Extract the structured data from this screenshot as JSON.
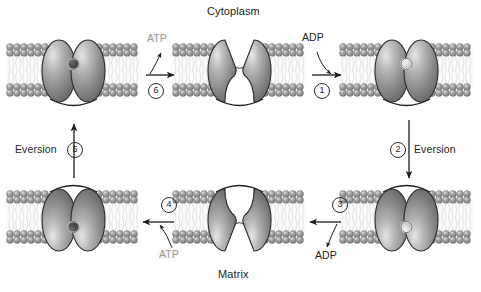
{
  "diagram": {
    "title_top": "Cytoplasm",
    "title_bottom": "Matrix",
    "type": "transport-cycle",
    "colors": {
      "protein_fill": "#8d8d8d",
      "protein_highlight": "#d8d8d8",
      "protein_outline": "#2b2b2b",
      "lipid_head": "#9a9a9a",
      "lipid_tail": "#f2f2f2",
      "arrow": "#1d1d1d",
      "atp_text": "#9b9b9b",
      "adp_text": "#1d1d1d",
      "substrate_dark": "#4a4a4a",
      "substrate_light": "#dcdcdc"
    }
  },
  "states": [
    {
      "id": "state-top-left",
      "name": "cytoplasm-facing-atp-bound",
      "orientation": "open-down",
      "substrate": "ATP",
      "substrate_shade": "dark"
    },
    {
      "id": "state-top-middle",
      "name": "cytoplasm-facing-empty",
      "orientation": "open-up",
      "substrate": "none",
      "substrate_shade": "none"
    },
    {
      "id": "state-top-right",
      "name": "cytoplasm-facing-adp-bound",
      "orientation": "open-down",
      "substrate": "ADP",
      "substrate_shade": "light"
    },
    {
      "id": "state-bottom-right",
      "name": "matrix-facing-adp-bound",
      "orientation": "open-up",
      "substrate": "ADP",
      "substrate_shade": "light"
    },
    {
      "id": "state-bottom-middle",
      "name": "matrix-facing-empty",
      "orientation": "open-down",
      "substrate": "none",
      "substrate_shade": "none"
    },
    {
      "id": "state-bottom-left",
      "name": "matrix-facing-atp-bound",
      "orientation": "open-up",
      "substrate": "ATP",
      "substrate_shade": "dark"
    }
  ],
  "steps": [
    {
      "number": "1",
      "glyph": "1",
      "label": "",
      "ligand": "ADP",
      "ligand_action": "binds",
      "direction": "right"
    },
    {
      "number": "2",
      "glyph": "2",
      "label": "Eversion",
      "ligand": "",
      "ligand_action": "",
      "direction": "down"
    },
    {
      "number": "3",
      "glyph": "3",
      "label": "",
      "ligand": "ADP",
      "ligand_action": "released",
      "direction": "left"
    },
    {
      "number": "4",
      "glyph": "4",
      "label": "",
      "ligand": "ATP",
      "ligand_action": "binds",
      "direction": "left"
    },
    {
      "number": "5",
      "glyph": "5",
      "label": "Eversion",
      "ligand": "",
      "ligand_action": "",
      "direction": "up"
    },
    {
      "number": "6",
      "glyph": "6",
      "label": "",
      "ligand": "ATP",
      "ligand_action": "released",
      "direction": "right"
    }
  ],
  "labels": {
    "cytoplasm": "Cytoplasm",
    "matrix": "Matrix",
    "eversion_left": "Eversion",
    "eversion_right": "Eversion",
    "atp_top": "ATP",
    "adp_top": "ADP",
    "adp_bottom": "ADP",
    "atp_bottom": "ATP",
    "step1": "1",
    "step2": "2",
    "step3": "3",
    "step4": "4",
    "step5": "5",
    "step6": "6"
  }
}
